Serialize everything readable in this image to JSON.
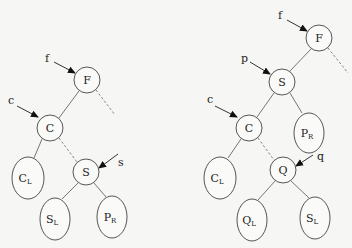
{
  "diagram": {
    "type": "binary-tree-rotation",
    "left_tree": {
      "nodes": [
        {
          "id": "F",
          "label": "F",
          "sub": "",
          "shape": "circle",
          "cx": 87,
          "cy": 80,
          "r": 13
        },
        {
          "id": "C",
          "label": "C",
          "sub": "",
          "shape": "circle",
          "cx": 50,
          "cy": 128,
          "r": 13
        },
        {
          "id": "CL",
          "label": "C",
          "sub": "L",
          "shape": "ellipse",
          "cx": 28,
          "cy": 178,
          "rx": 16,
          "ry": 21
        },
        {
          "id": "S",
          "label": "S",
          "sub": "",
          "shape": "circle",
          "cx": 86,
          "cy": 172,
          "r": 13
        },
        {
          "id": "SL",
          "label": "S",
          "sub": "L",
          "shape": "ellipse",
          "cx": 55,
          "cy": 219,
          "rx": 15,
          "ry": 21
        },
        {
          "id": "PR",
          "label": "P",
          "sub": "R",
          "shape": "ellipse",
          "cx": 112,
          "cy": 217,
          "rx": 15,
          "ry": 21
        }
      ],
      "pointers": [
        {
          "label": "f",
          "target": "F"
        },
        {
          "label": "c",
          "target": "C"
        },
        {
          "label": "s",
          "target": "S"
        }
      ]
    },
    "right_tree": {
      "nodes": [
        {
          "id": "F",
          "label": "F",
          "sub": "",
          "shape": "circle"
        },
        {
          "id": "S",
          "label": "S",
          "sub": "",
          "shape": "circle"
        },
        {
          "id": "C",
          "label": "C",
          "sub": "",
          "shape": "circle"
        },
        {
          "id": "PR",
          "label": "P",
          "sub": "R",
          "shape": "ellipse"
        },
        {
          "id": "CL",
          "label": "C",
          "sub": "L",
          "shape": "ellipse"
        },
        {
          "id": "Q",
          "label": "Q",
          "sub": "",
          "shape": "circle"
        },
        {
          "id": "QL",
          "label": "Q",
          "sub": "L",
          "shape": "ellipse"
        },
        {
          "id": "SL",
          "label": "S",
          "sub": "L",
          "shape": "ellipse"
        }
      ],
      "pointers": [
        {
          "label": "f",
          "target": "F"
        },
        {
          "label": "p",
          "target": "S"
        },
        {
          "label": "c",
          "target": "C"
        },
        {
          "label": "q",
          "target": "Q"
        }
      ]
    }
  }
}
